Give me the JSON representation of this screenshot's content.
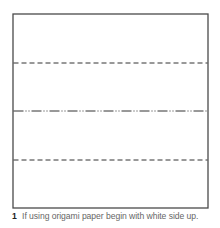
{
  "diagram": {
    "square": {
      "x": 13,
      "y": 14,
      "width": 195,
      "height": 194,
      "stroke": "#4a4a4a"
    },
    "lines": [
      {
        "name": "valley-fold-top",
        "type": "dashed",
        "y": 63,
        "stroke": "#333333"
      },
      {
        "name": "mountain-fold-middle",
        "type": "dash-dot",
        "y": 111,
        "stroke": "#333333"
      },
      {
        "name": "valley-fold-bottom",
        "type": "dashed",
        "y": 160,
        "stroke": "#333333"
      }
    ]
  },
  "caption": {
    "step_number": "1",
    "text": "If using origami paper begin with white side up."
  }
}
